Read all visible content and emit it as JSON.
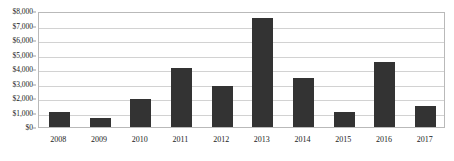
{
  "chart_data": {
    "type": "bar",
    "title": "",
    "xlabel": "",
    "ylabel": "",
    "categories": [
      "2008",
      "2009",
      "2010",
      "2011",
      "2012",
      "2013",
      "2014",
      "2015",
      "2016",
      "2017"
    ],
    "values": [
      1050,
      600,
      1900,
      4100,
      2800,
      7550,
      3350,
      1050,
      4500,
      1450
    ],
    "ylim": [
      0,
      8000
    ],
    "y_tick_values": [
      0,
      1000,
      2000,
      3000,
      4000,
      5000,
      6000,
      7000,
      8000
    ],
    "y_tick_labels": [
      "$0",
      "$1,000",
      "$2,000",
      "$3,000",
      "$4,000",
      "$5,000",
      "$6,000",
      "$7,000",
      "$8,000"
    ],
    "grid": true,
    "legend": false,
    "legend_position": "none",
    "series": [
      {
        "name": "",
        "values": [
          1050,
          600,
          1900,
          4100,
          2800,
          7550,
          3350,
          1050,
          4500,
          1450
        ]
      }
    ]
  },
  "style": {
    "bar_color": "#333333",
    "gridline_color": "#d2d2d2",
    "frame_color": "#b9b9b9",
    "background": "#ffffff",
    "text_color": "#1a1a1a"
  }
}
